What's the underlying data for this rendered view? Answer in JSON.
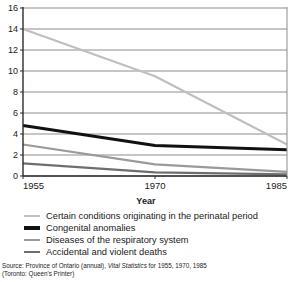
{
  "chart_data": {
    "type": "line",
    "title": "",
    "xlabel": "Year",
    "ylabel": "",
    "x": [
      1955,
      1970,
      1985
    ],
    "categories": [
      "1955",
      "1970",
      "1985"
    ],
    "xlim": [
      1955,
      1985
    ],
    "ylim": [
      0,
      16
    ],
    "ytick_values": [
      0,
      2,
      4,
      6,
      8,
      10,
      12,
      14,
      16
    ],
    "ytick_labels": [
      "0",
      "2",
      "4",
      "6",
      "8",
      "10",
      "12",
      "14",
      "16"
    ],
    "xtick_labels": [
      "1955",
      "1970",
      "1985"
    ],
    "grid": "horizontal",
    "legend_position": "below",
    "series": [
      {
        "name": "Certain conditions originating in the perinatal period",
        "values": [
          14.0,
          9.5,
          3.0
        ],
        "color": "#bfbfbf",
        "width": 2.2
      },
      {
        "name": "Congenital anomalies",
        "values": [
          4.8,
          2.9,
          2.5
        ],
        "color": "#111111",
        "width": 3.0
      },
      {
        "name": "Diseases of the respiratory system",
        "values": [
          3.0,
          1.1,
          0.4
        ],
        "color": "#9a9a9a",
        "width": 2.2
      },
      {
        "name": "Accidental and violent deaths",
        "values": [
          1.2,
          0.35,
          0.15
        ],
        "color": "#6e6e6e",
        "width": 2.2
      }
    ]
  },
  "axis": {
    "x_title": "Year"
  },
  "legend": {
    "items": [
      {
        "label": "Certain conditions originating in the perinatal period"
      },
      {
        "label": "Congenital anomalies"
      },
      {
        "label": "Diseases of the respiratory system"
      },
      {
        "label": "Accidental and violent deaths"
      }
    ]
  },
  "source": {
    "line1_prefix": "Source: Province of Ontario (annual), ",
    "line1_italic": "Vital Statistics",
    "line1_suffix": " for 1955, 1970, 1985",
    "line2": "(Toronto: Queen's Printer)"
  },
  "colors": {
    "axis": "#2b2b2b",
    "grid": "#8c8c8c",
    "text": "#1a1a1a",
    "background": "#ffffff"
  }
}
